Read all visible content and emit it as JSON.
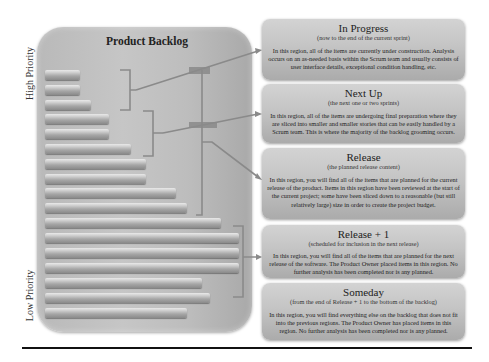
{
  "axis": {
    "high_label": "High Priority",
    "low_label": "Low Priority"
  },
  "backlog": {
    "title": "Product Backlog",
    "bars": [
      {
        "top": 70,
        "right": 80
      },
      {
        "top": 85,
        "right": 80
      },
      {
        "top": 100,
        "right": 91
      },
      {
        "top": 114,
        "right": 109
      },
      {
        "top": 129,
        "right": 109
      },
      {
        "top": 144,
        "right": 131
      },
      {
        "top": 159,
        "right": 146
      },
      {
        "top": 174,
        "right": 146
      },
      {
        "top": 188,
        "right": 176
      },
      {
        "top": 203,
        "right": 187
      },
      {
        "top": 218,
        "right": 221
      },
      {
        "top": 233,
        "right": 239
      },
      {
        "top": 248,
        "right": 239
      },
      {
        "top": 263,
        "right": 239
      },
      {
        "top": 278,
        "right": 202
      },
      {
        "top": 293,
        "right": 210
      },
      {
        "top": 308,
        "right": 187
      }
    ]
  },
  "regions": [
    {
      "title": "In Progress",
      "subtitle": "(now to the end of the current sprint)",
      "body": "In this region, all of the items are currently under construction. Analysis occurs on an as-needed basis within the Scrum team and usually consists of user interface details, exceptional condition handling, etc."
    },
    {
      "title": "Next Up",
      "subtitle": "(the next one or two sprints)",
      "body": "In this region, all of the items are undergoing final preparation where they are sliced into smaller and smaller stories that can be easily handled by a Scrum team. This is where the majority of the backlog grooming occurs."
    },
    {
      "title": "Release",
      "subtitle": "(the planned release content)",
      "body": "In this region, you will find all of the items that are planned for the current release of the product. Items in this region have been reviewed at the start of the current project; some have been sliced down to a reasonable (but still relatively large) size in order to create the project budget."
    },
    {
      "title": "Release + 1",
      "subtitle": "(scheduled for inclusion in the next release)",
      "body": "In this region, you will find all of the items that are planned for the next release of the software. The Product Owner placed items in this region. No further analysis has been completed nor is any planned."
    },
    {
      "title": "Someday",
      "subtitle": "(from the end of Release + 1 to the bottom of the backlog)",
      "body": "In this region, you will find everything else on the backlog that does not fit into the previous regions. The Product Owner has placed items in this region. No further analysis has been completed nor is any planned."
    }
  ],
  "colors": {
    "connector": "#8a8a8a",
    "panel": "#c0c0c0",
    "rule": "#111111"
  }
}
